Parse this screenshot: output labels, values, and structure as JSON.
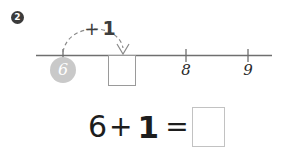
{
  "colors": {
    "background": "#ffffff",
    "marker_bg": "#3b3b3b",
    "marker_text": "#ffffff",
    "line": "#6f6f6f",
    "arc": "#8a8a8a",
    "chip_bg": "#c9c9c9",
    "chip_text": "#ffffff",
    "box_border_line": "#9a9a9a",
    "box_border_equation": "#c2c2c2",
    "text": "#1d1d1d"
  },
  "problem": {
    "number": "2"
  },
  "number_line": {
    "jump_label": {
      "operator": "+",
      "value": "1"
    },
    "start_value": "6",
    "answer_box_value": "",
    "ticks": [
      {
        "label": "6",
        "labeled": false,
        "highlighted": true
      },
      {
        "label": "7",
        "labeled": false,
        "highlighted": false
      },
      {
        "label": "8",
        "labeled": true,
        "highlighted": false
      },
      {
        "label": "9",
        "labeled": true,
        "highlighted": false
      }
    ],
    "visible_tick_labels": [
      "8",
      "9"
    ],
    "arrow_direction": "down",
    "arc_style": "dashed"
  },
  "equation": {
    "left_operand": "6",
    "operator": "+",
    "right_operand": "1",
    "equals": "=",
    "answer_value": ""
  },
  "icons": {
    "problem_marker": "filled-circle-number-icon",
    "jump_arrow": "curved-dashed-arrow-icon",
    "arrowhead": "arrowhead-down-icon"
  }
}
